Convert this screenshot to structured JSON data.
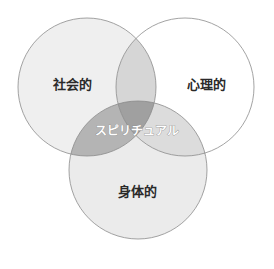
{
  "diagram": {
    "type": "venn",
    "sets": [
      {
        "id": "social",
        "label": "社会的",
        "fill": "#efefef"
      },
      {
        "id": "psychological",
        "label": "心理的",
        "fill": "#ffffff"
      },
      {
        "id": "physical",
        "label": "身体的",
        "fill": "#ebebeb"
      }
    ],
    "center_label": "スピリチュアル",
    "colors": {
      "stroke": "#8c8c8c",
      "overlap_social_psych": "#d6d6d6",
      "overlap_social_physical": "#b4b4b4",
      "overlap_psych_physical": "#dcdcdc",
      "overlap_all": "#a0a0a0"
    }
  }
}
